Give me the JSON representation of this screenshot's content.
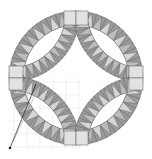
{
  "diagram": {
    "colors": {
      "background": "#ffffff",
      "band_dark": "#9a9a9a",
      "wedge_light": "#d6d6d6",
      "wedge_mid": "#bcbcbc",
      "block": "#e2e2e2",
      "stroke": "#555555",
      "grid": "#e6e6e6",
      "pointer": "#222222"
    },
    "ring": {
      "cx": 76,
      "cy": 78,
      "r_outer": 67,
      "r_inner": 53
    },
    "arcs": {
      "r_outer": 70,
      "r_inner": 56,
      "corners": [
        [
          10,
          12
        ],
        [
          143,
          12
        ],
        [
          10,
          146
        ],
        [
          143,
          146
        ]
      ]
    },
    "pointer": {
      "x1": 10,
      "y1": 148,
      "x2": 36,
      "y2": 84
    }
  }
}
